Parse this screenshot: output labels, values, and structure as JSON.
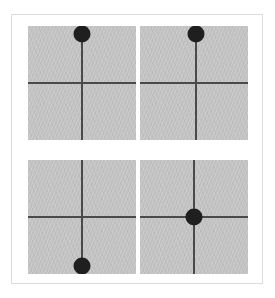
{
  "figure": {
    "background_color": "#ffffff",
    "frame_border_color": "#dcdcdc",
    "panel_fill_color": "#c2c2c2",
    "axis_color": "#4a4a4a",
    "marker_color": "#1f1f1f",
    "panel_count": 4,
    "grid_rows": 2,
    "grid_columns": 2
  },
  "panels": [
    {
      "id": "panel-top-left",
      "position": "top-left",
      "axis_vertical_x_pct": 50,
      "axis_horizontal_y_pct": 50,
      "marker": {
        "label": "marker-dot",
        "x_pct": 50,
        "y_pct": 7,
        "diameter_px": 17,
        "orientation": "up"
      }
    },
    {
      "id": "panel-top-right",
      "position": "top-right",
      "axis_vertical_x_pct": 52,
      "axis_horizontal_y_pct": 50,
      "marker": {
        "label": "marker-dot",
        "x_pct": 52,
        "y_pct": 7,
        "diameter_px": 17,
        "orientation": "up"
      }
    },
    {
      "id": "panel-bottom-left",
      "position": "bottom-left",
      "axis_vertical_x_pct": 50,
      "axis_horizontal_y_pct": 50,
      "marker": {
        "label": "marker-dot",
        "x_pct": 50,
        "y_pct": 93,
        "diameter_px": 17,
        "orientation": "down"
      }
    },
    {
      "id": "panel-bottom-right",
      "position": "bottom-right",
      "axis_vertical_x_pct": 50,
      "axis_horizontal_y_pct": 50,
      "marker": {
        "label": "marker-dot",
        "x_pct": 50,
        "y_pct": 50,
        "diameter_px": 17,
        "orientation": "center"
      }
    }
  ]
}
